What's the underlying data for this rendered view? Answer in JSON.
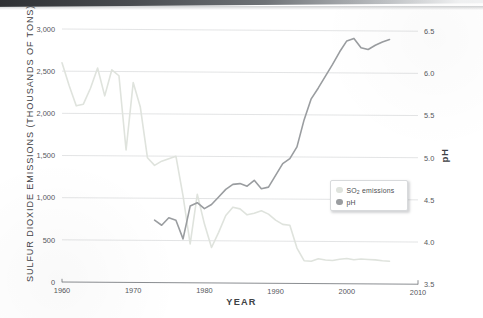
{
  "figure": {
    "background_color": "#ffffff",
    "scan_bar_color": "#2e3033"
  },
  "legend": {
    "position": "center-right-inside",
    "entries": [
      {
        "label_main": "SO",
        "label_sub": "2",
        "label_tail": " emissions",
        "color": "#dfe3dd",
        "name": "so2-emissions"
      },
      {
        "label_main": "pH",
        "label_sub": "",
        "label_tail": "",
        "color": "#9a9da0",
        "name": "ph"
      }
    ]
  },
  "chart_data": {
    "type": "line",
    "title": "",
    "subtitle": "",
    "xlabel": "YEAR",
    "ylabel": "SULFUR DIOXIDE EMISSIONS (THOUSANDS OF TONS)",
    "y2label": "pH",
    "xlim": [
      1960,
      2010
    ],
    "ylim": [
      0,
      3000
    ],
    "y2lim": [
      3.5,
      6.5
    ],
    "grid": true,
    "grid_axis": "y",
    "grid_color": "#d7d9da",
    "xticks": [
      1960,
      1970,
      1980,
      1990,
      2000,
      2010
    ],
    "xticklabels": [
      "1960",
      "1970",
      "1980",
      "1990",
      "2000",
      "2010"
    ],
    "yticks": [
      0,
      500,
      1000,
      1500,
      2000,
      2500,
      3000
    ],
    "yticklabels": [
      "0",
      "500",
      "1,000",
      "1,500",
      "2,000",
      "2,500",
      "3,000"
    ],
    "y2ticks": [
      3.5,
      4.0,
      4.5,
      5.0,
      5.5,
      6.0,
      6.5
    ],
    "y2ticklabels": [
      "3.5",
      "4.0",
      "4.5",
      "5.0",
      "5.5",
      "6.0",
      "6.5"
    ],
    "legend_position": "center right",
    "series": [
      {
        "name": "SO2 emissions",
        "axis": "left",
        "color": "#dfe3dd",
        "linewidth": 1.6,
        "units": "thousands of tons",
        "x": [
          1960,
          1961,
          1962,
          1963,
          1964,
          1965,
          1966,
          1967,
          1968,
          1969,
          1970,
          1971,
          1972,
          1973,
          1974,
          1975,
          1976,
          1977,
          1978,
          1979,
          1980,
          1981,
          1982,
          1983,
          1984,
          1985,
          1986,
          1987,
          1988,
          1989,
          1990,
          1991,
          1992,
          1993,
          1994,
          1995,
          1996,
          1997,
          1998,
          1999,
          2000,
          2001,
          2002,
          2003,
          2004,
          2005,
          2006
        ],
        "y": [
          2600,
          2330,
          2090,
          2110,
          2300,
          2540,
          2210,
          2520,
          2450,
          1570,
          2370,
          2080,
          1480,
          1390,
          1440,
          1470,
          1500,
          1030,
          460,
          1050,
          700,
          420,
          600,
          800,
          900,
          880,
          810,
          830,
          860,
          820,
          750,
          700,
          690,
          420,
          270,
          265,
          295,
          280,
          275,
          290,
          300,
          285,
          295,
          290,
          285,
          275,
          270
        ]
      },
      {
        "name": "pH",
        "axis": "right",
        "color": "#9a9da0",
        "linewidth": 1.6,
        "units": "pH",
        "x": [
          1973,
          1974,
          1975,
          1976,
          1977,
          1978,
          1979,
          1980,
          1981,
          1982,
          1983,
          1984,
          1985,
          1986,
          1987,
          1988,
          1989,
          1990,
          1991,
          1992,
          1993,
          1994,
          1995,
          1996,
          1997,
          1998,
          1999,
          2000,
          2001,
          2002,
          2003,
          2004,
          2005,
          2006
        ],
        "y": [
          4.24,
          4.18,
          4.27,
          4.24,
          4.02,
          4.41,
          4.45,
          4.38,
          4.43,
          4.52,
          4.61,
          4.67,
          4.68,
          4.65,
          4.72,
          4.62,
          4.64,
          4.78,
          4.92,
          4.98,
          5.12,
          5.44,
          5.69,
          5.82,
          5.96,
          6.1,
          6.25,
          6.38,
          6.41,
          6.3,
          6.28,
          6.33,
          6.37,
          6.4
        ]
      }
    ]
  }
}
